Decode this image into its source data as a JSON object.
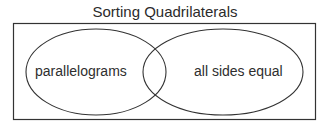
{
  "diagram": {
    "title": "Sorting Quadrilaterals",
    "type": "venn",
    "sets": [
      {
        "label": "parallelograms"
      },
      {
        "label": "all sides equal"
      }
    ],
    "colors": {
      "stroke": "#333333",
      "text": "#2e2e2e",
      "background": "#ffffff"
    }
  }
}
